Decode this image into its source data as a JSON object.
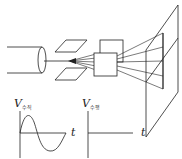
{
  "diagram": {
    "components": [
      "electron-gun",
      "vertical-deflection-plates",
      "horizontal-deflection-plates",
      "screen"
    ],
    "graphs": [
      {
        "axis_label": "V",
        "subscript": "수직",
        "time_label": "t",
        "waveform": "sine"
      },
      {
        "axis_label": "V",
        "subscript": "수평",
        "time_label": "t",
        "waveform": "zero"
      }
    ]
  }
}
